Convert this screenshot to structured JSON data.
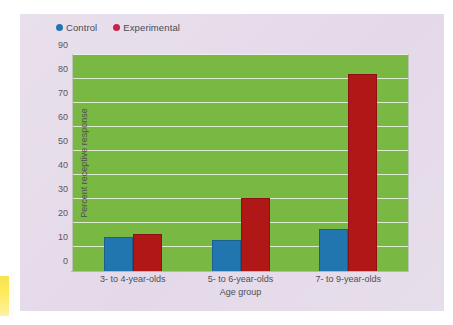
{
  "chart_data": {
    "type": "bar",
    "title": "",
    "categories": [
      "3- to 4-year-olds",
      "5- to 6-year-olds",
      "7- to 9-year-olds"
    ],
    "series": [
      {
        "name": "Control",
        "values": [
          14,
          13,
          17.5
        ],
        "color": "#2176b0"
      },
      {
        "name": "Experimental",
        "values": [
          15.5,
          30.5,
          82
        ],
        "color": "#b01818"
      }
    ],
    "xlabel": "Age group",
    "ylabel": "Percent receptive response",
    "ylim": [
      0,
      90
    ],
    "ytick_step": 10,
    "yticks": [
      "90",
      "80",
      "70",
      "60",
      "50",
      "40",
      "30",
      "20",
      "10",
      "0"
    ],
    "grid": true,
    "grid_color": "#ffffff",
    "legend_position": "top-left",
    "plot_background": "#79b943",
    "page_background": "#e6dcea"
  },
  "legend": {
    "items": [
      {
        "label": "Control",
        "color": "#2176b0"
      },
      {
        "label": "Experimental",
        "color": "#c8234a"
      }
    ]
  },
  "axes": {
    "ylabel": "Percent receptive response",
    "xlabel": "Age group"
  }
}
